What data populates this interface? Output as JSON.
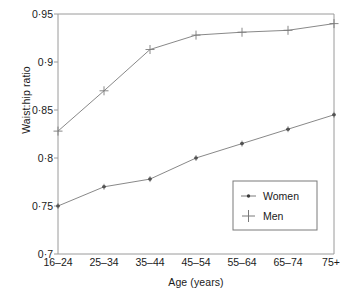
{
  "chart_data": {
    "type": "line",
    "title": "",
    "xlabel": "Age (years)",
    "ylabel": "Waist:hip ratio",
    "categories": [
      "16–24",
      "25–34",
      "35–44",
      "45–54",
      "55–64",
      "65–74",
      "75+"
    ],
    "ytick_labels": [
      "0·95",
      "0·9",
      "0·85",
      "0·8",
      "0·75",
      "0·7"
    ],
    "ytick_values": [
      0.95,
      0.9,
      0.85,
      0.8,
      0.75,
      0.7
    ],
    "ylim": [
      0.7,
      0.95
    ],
    "grid": false,
    "legend_position": "lower-right-inside",
    "series": [
      {
        "name": "Women",
        "marker": "dot",
        "values": [
          0.75,
          0.77,
          0.778,
          0.8,
          0.815,
          0.83,
          0.845
        ]
      },
      {
        "name": "Men",
        "marker": "plus",
        "values": [
          0.828,
          0.87,
          0.913,
          0.928,
          0.931,
          0.933,
          0.94
        ]
      }
    ],
    "line_color": "#7a7a7a",
    "axis_color": "#8c8c8c",
    "text_color": "#1a1a1a"
  },
  "legend": {
    "items": [
      {
        "label": "Women"
      },
      {
        "label": "Men"
      }
    ]
  }
}
